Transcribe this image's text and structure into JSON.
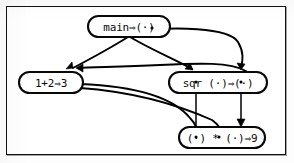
{
  "figure": {
    "caption": "",
    "background_color": "#ffffff",
    "border_color": "#111111",
    "ink_color": "#000000"
  },
  "nodes": [
    {
      "id": "main",
      "label": "main⇒(·)",
      "text_prefix": "main",
      "arrow_glyph": "⇒",
      "result_port": "(·)",
      "x": 88,
      "y": 16,
      "width": 82,
      "height": 21
    },
    {
      "id": "sum",
      "label": "1+2⇒3",
      "text_prefix": "1+2",
      "arrow_glyph": "⇒",
      "result_value": "3",
      "x": 19,
      "y": 72,
      "width": 64,
      "height": 21
    },
    {
      "id": "sqr",
      "label": "sqr (·)⇒(·)",
      "text_prefix": "sqr",
      "arrow_glyph": "⇒",
      "argument_port": "(·)",
      "result_port": "(·)",
      "x": 169,
      "y": 72,
      "width": 98,
      "height": 21
    },
    {
      "id": "mul",
      "label": "(·) * (·)⇒9",
      "arrow_glyph": "⇒",
      "left_port": "(·)",
      "operator": "*",
      "right_port": "(·)",
      "result_value": "9",
      "x": 179,
      "y": 127,
      "width": 86,
      "height": 21
    }
  ],
  "edges": [
    {
      "id": "main-to-sum",
      "from": "main",
      "to": "sum",
      "arrowhead": true
    },
    {
      "id": "main-to-sqr-arg",
      "from": "main",
      "to": "sqr",
      "arrowhead": true
    },
    {
      "id": "main-port-to-sqr-result",
      "from": "main",
      "to": "sqr",
      "arrowhead": true
    },
    {
      "id": "sqr-result-to-sum",
      "from": "sqr",
      "to": "sum",
      "arrowhead": true
    },
    {
      "id": "sum-to-mul-left",
      "from": "sum",
      "to": "mul",
      "arrowhead": false
    },
    {
      "id": "sum-to-mul-right",
      "from": "sum",
      "to": "mul",
      "arrowhead": false
    },
    {
      "id": "sqr-arg-to-mul",
      "from": "sqr",
      "to": "mul",
      "arrowhead": false
    },
    {
      "id": "sqr-result-to-mul",
      "from": "sqr",
      "to": "mul",
      "arrowhead": true
    }
  ]
}
